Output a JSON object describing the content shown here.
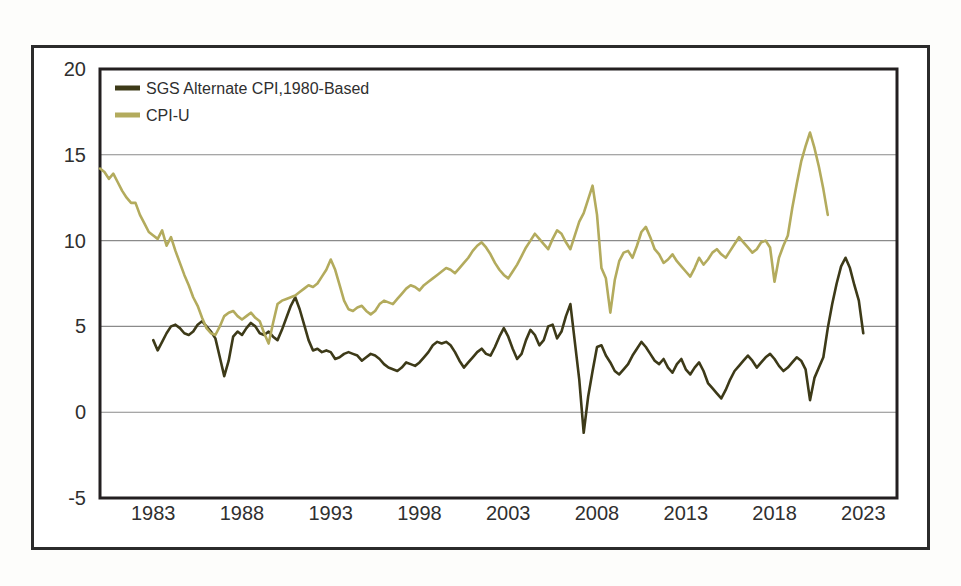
{
  "figure": {
    "background": "#ffffff",
    "frame_color": "#2b2b2b"
  },
  "chart_data": {
    "type": "line",
    "title": "",
    "subtitle": "",
    "xlabel": "",
    "ylabel": "",
    "xlim": [
      1980.0,
      2024.9
    ],
    "ylim": [
      -5,
      20
    ],
    "yticks": [
      -5,
      0,
      5,
      10,
      15,
      20
    ],
    "ytick_labels": [
      "-5",
      "0",
      "5",
      "10",
      "15",
      "20"
    ],
    "xticks": [
      1983,
      1988,
      1993,
      1998,
      2003,
      2008,
      2013,
      2018,
      2023
    ],
    "xtick_labels": [
      "1983",
      "1988",
      "1993",
      "1998",
      "2003",
      "2008",
      "2013",
      "2018",
      "2023"
    ],
    "gridlines": {
      "horizontal_at": [
        0,
        5,
        10,
        15
      ],
      "vertical": false,
      "color": "#8a8a8a"
    },
    "legend": {
      "position": "top-left-inside",
      "entries": [
        {
          "name": "SGS Alternate CPI,1980-Based",
          "color": "#3d3a18"
        },
        {
          "name": "CPI-U",
          "color": "#b3ab5d"
        }
      ]
    },
    "series": [
      {
        "name": "SGS Alternate CPI,1980-Based",
        "color": "#3d3a18",
        "linewidth": 2.6,
        "x_start": 1983.0,
        "x_step": 0.25,
        "values": [
          4.2,
          3.6,
          4.1,
          4.6,
          5.0,
          5.1,
          4.9,
          4.6,
          4.5,
          4.7,
          5.1,
          5.3,
          5.0,
          4.7,
          4.3,
          3.2,
          2.1,
          3.0,
          4.4,
          4.7,
          4.5,
          4.9,
          5.2,
          5.0,
          4.6,
          4.5,
          4.7,
          4.4,
          4.2,
          4.8,
          5.5,
          6.2,
          6.7,
          6.0,
          5.1,
          4.2,
          3.6,
          3.7,
          3.5,
          3.6,
          3.5,
          3.1,
          3.2,
          3.4,
          3.5,
          3.4,
          3.3,
          3.0,
          3.2,
          3.4,
          3.3,
          3.1,
          2.8,
          2.6,
          2.5,
          2.4,
          2.6,
          2.9,
          2.8,
          2.7,
          2.9,
          3.2,
          3.5,
          3.9,
          4.1,
          4.0,
          4.1,
          3.9,
          3.5,
          3.0,
          2.6,
          2.9,
          3.2,
          3.5,
          3.7,
          3.4,
          3.3,
          3.8,
          4.4,
          4.9,
          4.4,
          3.7,
          3.1,
          3.4,
          4.2,
          4.8,
          4.5,
          3.9,
          4.2,
          5.0,
          5.1,
          4.3,
          4.7,
          5.6,
          6.3,
          4.1,
          1.9,
          -1.2,
          0.9,
          2.4,
          3.8,
          3.9,
          3.3,
          2.9,
          2.4,
          2.2,
          2.5,
          2.8,
          3.3,
          3.7,
          4.1,
          3.8,
          3.4,
          3.0,
          2.8,
          3.1,
          2.6,
          2.3,
          2.8,
          3.1,
          2.5,
          2.2,
          2.6,
          2.9,
          2.4,
          1.7,
          1.4,
          1.1,
          0.8,
          1.3,
          1.9,
          2.4,
          2.7,
          3.0,
          3.3,
          3.0,
          2.6,
          2.9,
          3.2,
          3.4,
          3.1,
          2.7,
          2.4,
          2.6,
          2.9,
          3.2,
          3.0,
          2.5,
          0.7,
          2.0,
          2.6,
          3.2,
          4.9,
          6.3,
          7.5,
          8.5,
          9.0,
          8.4,
          7.4,
          6.5,
          4.6
        ]
      },
      {
        "name": "CPI-U",
        "color": "#b3ab5d",
        "linewidth": 2.6,
        "x_start": 1980.0,
        "x_step": 0.25,
        "values": [
          14.2,
          14.0,
          13.6,
          13.9,
          13.4,
          12.9,
          12.5,
          12.2,
          12.2,
          11.5,
          11.0,
          10.5,
          10.3,
          10.1,
          10.6,
          9.7,
          10.2,
          9.4,
          8.7,
          8.0,
          7.4,
          6.7,
          6.2,
          5.5,
          4.9,
          4.6,
          4.5,
          5.0,
          5.6,
          5.8,
          5.9,
          5.6,
          5.4,
          5.6,
          5.8,
          5.5,
          5.3,
          4.6,
          4.0,
          5.2,
          6.3,
          6.5,
          6.6,
          6.7,
          6.8,
          7.0,
          7.2,
          7.4,
          7.3,
          7.5,
          7.9,
          8.3,
          8.9,
          8.3,
          7.4,
          6.5,
          6.0,
          5.9,
          6.1,
          6.2,
          5.9,
          5.7,
          5.9,
          6.3,
          6.5,
          6.4,
          6.3,
          6.6,
          6.9,
          7.2,
          7.4,
          7.3,
          7.1,
          7.4,
          7.6,
          7.8,
          8.0,
          8.2,
          8.4,
          8.3,
          8.1,
          8.4,
          8.7,
          9.0,
          9.4,
          9.7,
          9.9,
          9.6,
          9.2,
          8.7,
          8.3,
          8.0,
          7.8,
          8.2,
          8.6,
          9.1,
          9.6,
          10.0,
          10.4,
          10.1,
          9.8,
          9.5,
          10.1,
          10.6,
          10.4,
          9.9,
          9.5,
          10.3,
          11.1,
          11.6,
          12.4,
          13.2,
          11.5,
          8.4,
          7.8,
          5.8,
          7.7,
          8.8,
          9.3,
          9.4,
          9.0,
          9.7,
          10.5,
          10.8,
          10.2,
          9.5,
          9.2,
          8.7,
          8.9,
          9.2,
          8.8,
          8.5,
          8.2,
          7.9,
          8.4,
          9.0,
          8.6,
          8.9,
          9.3,
          9.5,
          9.2,
          9.0,
          9.4,
          9.8,
          10.2,
          9.9,
          9.6,
          9.3,
          9.5,
          9.9,
          10.0,
          9.6,
          7.6,
          9.0,
          9.7,
          10.3,
          11.9,
          13.3,
          14.6,
          15.5,
          16.3,
          15.4,
          14.3,
          13.0,
          11.5
        ]
      }
    ]
  },
  "axes": {
    "y_axis_name": "percent-change-axis",
    "x_axis_name": "year-axis"
  }
}
